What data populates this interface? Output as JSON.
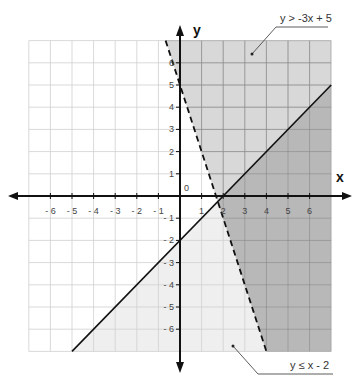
{
  "chart_data": {
    "type": "inequality-graph",
    "title": "",
    "xlabel": "x",
    "ylabel": "y",
    "xlim": [
      -7,
      7
    ],
    "ylim": [
      -7,
      7
    ],
    "grid": true,
    "origin_label": "0",
    "x_ticks": [
      -6,
      -5,
      -4,
      -3,
      -2,
      -1,
      1,
      2,
      3,
      4,
      5,
      6
    ],
    "y_ticks": [
      -6,
      -5,
      -4,
      -3,
      -2,
      -1,
      1,
      2,
      3,
      4,
      5,
      6
    ],
    "x_tick_labels": [
      "- 6",
      "- 5",
      "- 4",
      "- 3",
      "- 2",
      "- 1",
      "1",
      "2",
      "3",
      "4",
      "5",
      "6"
    ],
    "y_tick_labels": [
      "- 6",
      "- 5",
      "- 4",
      "- 3",
      "- 2",
      "- 1",
      "1",
      "2",
      "3",
      "4",
      "5",
      "6"
    ],
    "series": [
      {
        "name": "y > -3x + 5",
        "boundary": {
          "slope": -3,
          "intercept": 5,
          "style": "dashed"
        },
        "shade": "above",
        "color": "#d8d8d8",
        "annotation_text": "y > -3x + 5"
      },
      {
        "name": "y ≤ x - 2",
        "boundary": {
          "slope": 1,
          "intercept": -2,
          "style": "solid"
        },
        "shade": "below",
        "color": "#efefef",
        "annotation_text": "y ≤ x - 2"
      }
    ],
    "overlap_color": "#b8b8b8",
    "intersection_point": [
      1.75,
      -0.25
    ]
  },
  "labels": {
    "x_axis": "x",
    "y_axis": "y",
    "origin": "0",
    "ineq_upper": "y > -3x + 5",
    "ineq_lower": "y ≤ x - 2"
  },
  "colors": {
    "grid_light": "#cfcfcf",
    "grid_dark": "#8c8c8c",
    "axis": "#111111",
    "region_upper": "#d8d8d8",
    "region_lower": "#efefef",
    "region_overlap": "#b8b8b8"
  }
}
